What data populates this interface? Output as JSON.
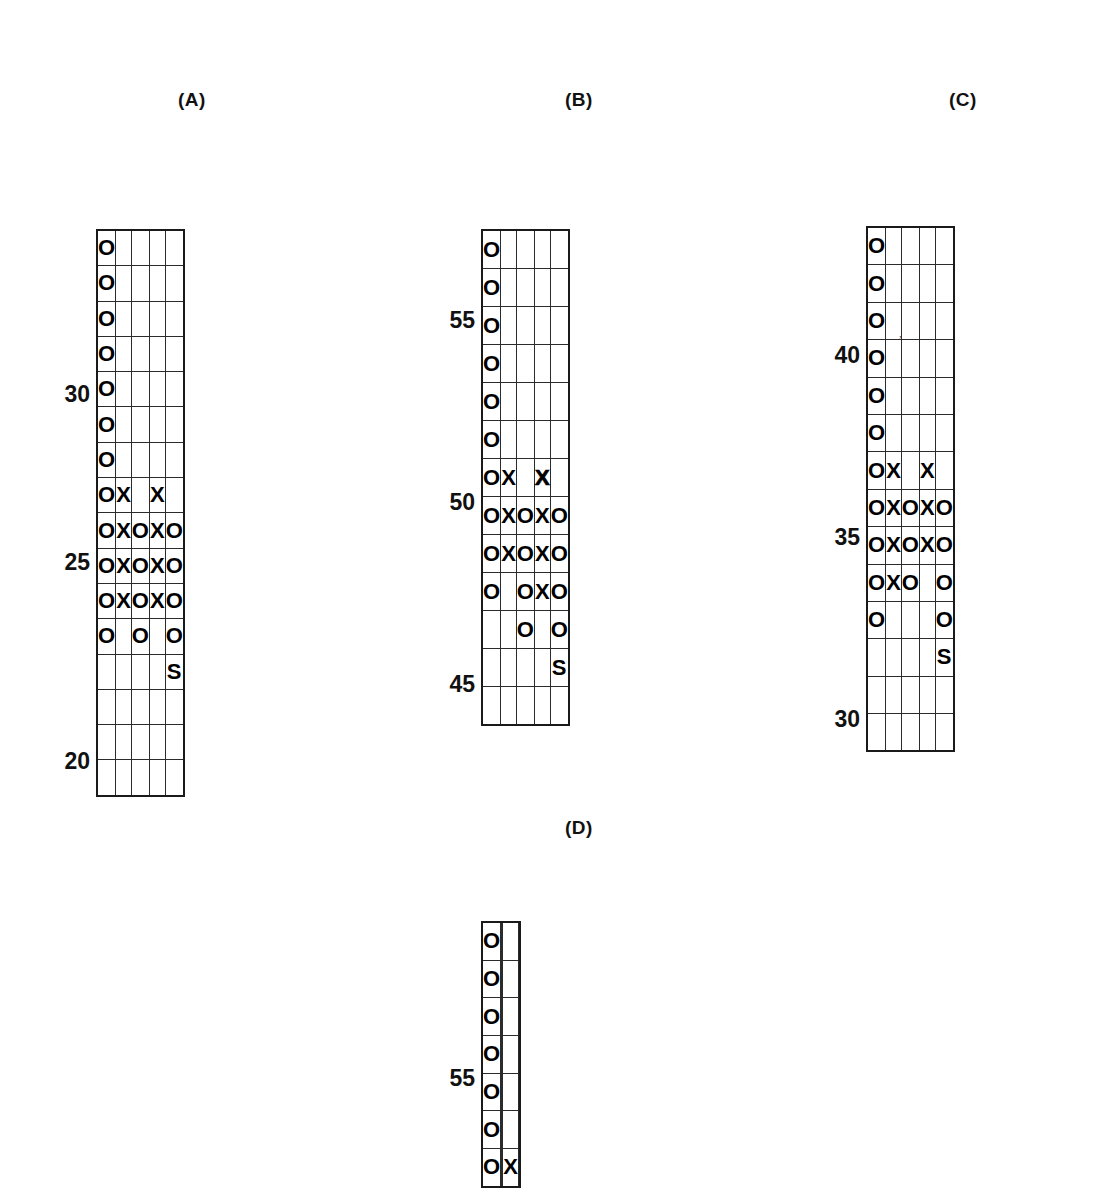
{
  "figure": {
    "background_color": "#ffffff",
    "ink_color": "#000000"
  },
  "chart_data": [
    {
      "id": "A",
      "type": "table",
      "title": "(A)",
      "columns": 5,
      "rows": 16,
      "ylabel": "",
      "axis_labels": [
        {
          "text": "30",
          "row_index": 4
        },
        {
          "text": "25",
          "row_index": 10
        },
        {
          "text": "20",
          "row_index": 15
        }
      ],
      "cells": [
        [
          "O",
          "",
          "",
          "",
          ""
        ],
        [
          "O",
          "",
          "",
          "",
          ""
        ],
        [
          "O",
          "",
          "",
          "",
          ""
        ],
        [
          "O",
          "",
          "",
          "",
          ""
        ],
        [
          "O",
          "",
          "",
          "",
          ""
        ],
        [
          "O",
          "",
          "",
          "",
          ""
        ],
        [
          "O",
          "",
          "",
          "",
          ""
        ],
        [
          "O",
          "X",
          "",
          "X",
          ""
        ],
        [
          "O",
          "X",
          "O",
          "X",
          "O"
        ],
        [
          "O",
          "X",
          "O",
          "X",
          "O"
        ],
        [
          "O",
          "X",
          "O",
          "X",
          "O"
        ],
        [
          "O",
          "",
          "O",
          "",
          "O"
        ],
        [
          "",
          "",
          "",
          "",
          "S"
        ],
        [
          "",
          "",
          "",
          "",
          ""
        ],
        [
          "",
          "",
          "",
          "",
          ""
        ],
        [
          "",
          "",
          "",
          "",
          ""
        ]
      ]
    },
    {
      "id": "B",
      "type": "table",
      "title": "(B)",
      "columns": 5,
      "rows": 13,
      "ylabel": "",
      "axis_labels": [
        {
          "text": "55",
          "row_index": 2
        },
        {
          "text": "50",
          "row_index": 7
        },
        {
          "text": "45",
          "row_index": 12
        }
      ],
      "cells": [
        [
          "O",
          "",
          "",
          "",
          ""
        ],
        [
          "O",
          "",
          "",
          "",
          ""
        ],
        [
          "O",
          "",
          "",
          "",
          ""
        ],
        [
          "O",
          "",
          "",
          "",
          ""
        ],
        [
          "O",
          "",
          "",
          "",
          ""
        ],
        [
          "O",
          "",
          "",
          "",
          ""
        ],
        [
          "O",
          "X",
          "",
          "X",
          ""
        ],
        [
          "O",
          "X",
          "O",
          "X",
          "O"
        ],
        [
          "O",
          "X",
          "O",
          "X",
          "O"
        ],
        [
          "O",
          "",
          "O",
          "X",
          "O"
        ],
        [
          "",
          "",
          "O",
          "",
          "O"
        ],
        [
          "",
          "",
          "",
          "",
          "S"
        ],
        [
          "",
          "",
          "",
          "",
          ""
        ]
      ]
    },
    {
      "id": "C",
      "type": "table",
      "title": "(C)",
      "columns": 5,
      "rows": 14,
      "ylabel": "",
      "axis_labels": [
        {
          "text": "40",
          "row_index": 3
        },
        {
          "text": "35",
          "row_index": 8
        },
        {
          "text": "30",
          "row_index": 13
        }
      ],
      "cells": [
        [
          "O",
          "",
          "",
          "",
          ""
        ],
        [
          "O",
          "",
          "",
          "",
          ""
        ],
        [
          "O",
          "",
          "",
          "",
          ""
        ],
        [
          "O",
          "",
          "",
          "",
          ""
        ],
        [
          "O",
          "",
          "",
          "",
          ""
        ],
        [
          "O",
          "",
          "",
          "",
          ""
        ],
        [
          "O",
          "X",
          "",
          "X",
          ""
        ],
        [
          "O",
          "X",
          "O",
          "X",
          "O"
        ],
        [
          "O",
          "X",
          "O",
          "X",
          "O"
        ],
        [
          "O",
          "X",
          "O",
          "",
          "O"
        ],
        [
          "O",
          "",
          "",
          "",
          "O"
        ],
        [
          "",
          "",
          "",
          "",
          "S"
        ],
        [
          "",
          "",
          "",
          "",
          ""
        ],
        [
          "",
          "",
          "",
          "",
          ""
        ]
      ]
    },
    {
      "id": "D",
      "type": "table",
      "title": "(D)",
      "columns": 5,
      "rows": 7,
      "ylabel": "",
      "clipped": "bottom edge cut off by image boundary",
      "axis_labels": [
        {
          "text": "55",
          "row_index": 4
        }
      ],
      "cells": [
        [
          "O",
          "",
          "",
          "",
          ""
        ],
        [
          "O",
          "",
          "",
          "",
          ""
        ],
        [
          "O",
          "",
          "",
          "",
          ""
        ],
        [
          "O",
          "",
          "",
          "",
          ""
        ],
        [
          "O",
          "",
          "",
          "",
          ""
        ],
        [
          "O",
          "",
          "",
          "",
          ""
        ],
        [
          "O",
          "",
          "",
          "X",
          ""
        ]
      ]
    }
  ],
  "artifacts": {
    "smudge_mark": ","
  }
}
